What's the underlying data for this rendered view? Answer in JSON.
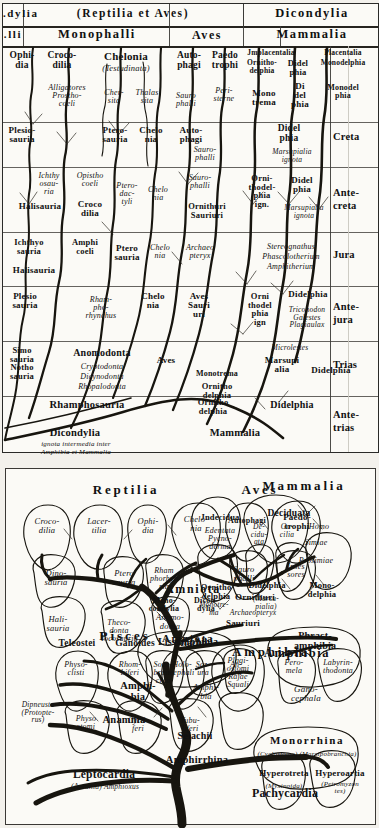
{
  "plate": {
    "title_top_left_cropped": ".dylia",
    "title_top_left_cropped2": ".lli"
  },
  "top_panel": {
    "header_row1": [
      {
        "text": "(Reptilia et Aves)",
        "style": "spaced"
      },
      {
        "text": "Dicondylia",
        "style": "spaced"
      }
    ],
    "header_row2": [
      {
        "text": "Monophalli"
      },
      {
        "text": "Aves"
      },
      {
        "text": "Mammalia"
      }
    ],
    "row_recent": [
      "Ophi-\ndia",
      "Croco-\ndilia",
      "Chelonia",
      "(Testudinata)",
      "Auto-\nphagi",
      "Paedo\ntrophi",
      "Jmplacentalia",
      "Ornitho-\ndelphia",
      "Didel\nphia",
      "Placentalia",
      "Monodelphia"
    ],
    "row_tertiary": [
      "Alligatores\nProstho-\ncoeli",
      "Cher-\nsita",
      "Thalas\nsita",
      "Peri-\nsterne",
      "Sauro\nphalli",
      "Mono\ntrema",
      "Di\ndel\nphia",
      "Monodel\nphia"
    ],
    "row_creta": [
      "Plesio-\nsauria",
      "Ptero-\nsauria",
      "Chelo\nnia",
      "Auto-\nphagi",
      "Sauro-\nphalli",
      "Didel\nphia",
      "Marsupialia\nignota"
    ],
    "row_antecreta": [
      "Ichthy\nosau-\nria",
      "Halisauria",
      "Opistho\ncoeli",
      "Croco\ndilia",
      "Ptero-\ndac-\ntyli",
      "Chelo\nnia",
      "Sauro-\nphalli",
      "Ornithuri\nSauriuri",
      "Orni-\nthodel-\nphia\nign.",
      "Didel\nphia",
      "Marsupialia\nignota"
    ],
    "row_jura": [
      "Ichthyo\nsauria",
      "Halisauria",
      "Amphi\ncoeli",
      "Ptero\nsauria",
      "Chelo\nnia",
      "Archaeo\npteryx",
      "Stereognathus\nPhascolotherium\nAmphitherium"
    ],
    "row_antejura": [
      "Plesio\nsauria",
      "Rham-\npho-\nrhynchus",
      "Chelo\nnia",
      "Aves\nSauri\nuri",
      "Orni\nthodel\nphia\nign",
      "Didelphia",
      "Triconodon\nGalestes\nPlagiaulax"
    ],
    "row_trias": [
      "Simo\nsauria\nNotho\nsauria",
      "Anomodonta",
      "Cryptodonta\nDicynodonta\nRhopalodonta",
      "Aves",
      "Monotrema",
      "Ornitho\ndelphia",
      "Microlestes",
      "Marsupi\nalia",
      "Didelphia"
    ],
    "row_antetrias": [
      "Rhamphosauria",
      "Ornitho\ndelphia",
      "Didelphia",
      "Dicondylia",
      "Mammalia",
      "ignota intermedia inter\nAmphibia et Mammalia"
    ],
    "periods": [
      "Creta",
      "Ante-\ncreta",
      "Jura",
      "Ante-\njura",
      "Trias",
      "Ante-\ntrias"
    ]
  },
  "bottom_panel": {
    "headers": [
      "Reptilia",
      "Aves",
      "Mammalia",
      "Pisces",
      "Amphibia"
    ],
    "reptilia": {
      "crowns": [
        "Croco-\ndilia",
        "Lacer-\ntilia",
        "Ophi-\ndia",
        "Chelo-\nnia"
      ],
      "inner": [
        "Dino-\nsauria",
        "Ptero\nsauria",
        "Rham\nphorhyn\nria",
        "Anamo-\ndonta",
        "Hali-\nsauria",
        "Theco-\ndonta\nTocosauria"
      ]
    },
    "aves": {
      "crowns": [
        "Autophagi",
        "Paedo-\ntrophi"
      ],
      "inner": [
        "Sauro\nphalli",
        "Inses\nsores",
        "Ornithuri",
        "Archaeopteryx",
        "Sauriuri"
      ]
    },
    "mammalia": {
      "crowns": [
        "Jndecidua",
        "Deciduata"
      ],
      "inner": [
        "Edentata\nPycno-\nderma",
        "De-\ncidu-\nata",
        "Go-\ncilia",
        "Homo",
        "Simiae",
        "Prosimiae",
        "Ornitho\ndelphia",
        "Monotre-\nma",
        "Didelphia",
        "(Marsu-\npialia)",
        "Mono-\ndelphia"
      ]
    },
    "pisces": {
      "crowns": [
        "Teleostei",
        "Ganoides",
        "Selachii"
      ],
      "inner": [
        "Physo-\nclisti",
        "Physo\nstomi",
        "Rhom-\nbiferi",
        "Cycli-\nferi",
        "Holo-\ncephali",
        "Tubu-\nliferi",
        "Plagi-\nostomi\nRajae\nSquali",
        "Dipneusta\n(Protopte-\nrus)",
        "Selachii"
      ]
    },
    "amphibia": {
      "crowns": [
        "Lissamphibia",
        "Phract-\namphibia"
      ],
      "inner": [
        "Sozo-\nbran-\nchia",
        "Soz-\nura",
        "An-\nura",
        "Pero-\nmela",
        "Labyrin-\nthodonta",
        "Amphi-\nbia",
        "Gano-\ncephala"
      ]
    },
    "monorrhina": {
      "title": "Monorrhina",
      "synonyms": "(Cyclostoma)   (Marsipobranchia)",
      "crowns": [
        "Hyperotreta",
        "Hyperoartia"
      ],
      "inner": [
        "(Myxinoida)",
        "(Petromyzon\ntes)"
      ]
    },
    "stems": [
      {
        "text": "Amniota",
        "size": "large"
      },
      {
        "text": "Mono-\ncondylia",
        "size": "small"
      },
      {
        "text": "Dicon-\ndylia",
        "size": "small"
      },
      {
        "text": "Amniota",
        "size": "large"
      },
      {
        "text": "Amphibia",
        "size": "large"
      },
      {
        "text": "Amphi-\nbia",
        "size": "mid"
      },
      {
        "text": "Anamnia",
        "size": "mid"
      },
      {
        "text": "Amphirrhina",
        "size": "mid"
      },
      {
        "text": "Leptocardia",
        "size": "mid"
      },
      {
        "text": "(Acrania) Amphioxus",
        "size": "tiny"
      },
      {
        "text": "Pachycardia",
        "size": "mid"
      }
    ]
  },
  "colors": {
    "ink": "#17150f",
    "paper": "#fbfaf6",
    "rule": "#3a3835"
  }
}
